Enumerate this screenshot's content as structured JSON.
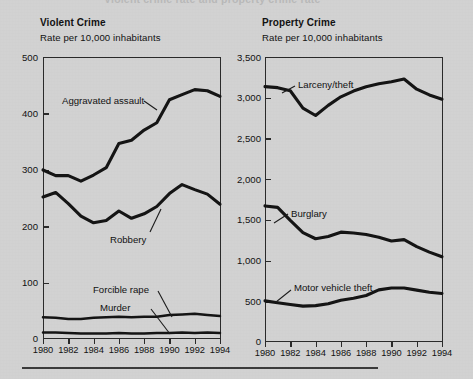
{
  "page": {
    "background_color": "#d2d2d2",
    "ink_color": "#141414",
    "cropped_top_title": "Violent crime rate and property crime rate"
  },
  "bottom_rule": "",
  "panels": [
    {
      "id": "violent-crime",
      "title": "Violent Crime",
      "subtitle": "Rate per 10,000 inhabitants"
    },
    {
      "id": "property-crime",
      "title": "Property Crime",
      "subtitle": "Rate per 10,000 inhabitants"
    }
  ],
  "chart_data": [
    {
      "type": "line",
      "title": "Violent Crime",
      "subtitle": "Rate per 10,000 inhabitants",
      "xlabel": "",
      "ylabel": "Rate per 10,000 inhabitants",
      "grid": false,
      "legend": "inline-annotations",
      "x": [
        1980,
        1981,
        1982,
        1983,
        1984,
        1985,
        1986,
        1987,
        1988,
        1989,
        1990,
        1991,
        1992,
        1993,
        1994
      ],
      "xticks": [
        "1980",
        "1982",
        "1984",
        "1986",
        "1988",
        "1990",
        "1992",
        "1994"
      ],
      "ylim": [
        0,
        500
      ],
      "yticks": [
        "0",
        "100",
        "200",
        "300",
        "400",
        "500"
      ],
      "series": [
        {
          "name": "Aggravated assault",
          "values": [
            299,
            289,
            289,
            279,
            290,
            303,
            346,
            352,
            370,
            383,
            424,
            433,
            442,
            440,
            430
          ]
        },
        {
          "name": "Robbery",
          "values": [
            251,
            259,
            239,
            217,
            205,
            209,
            226,
            213,
            221,
            234,
            257,
            273,
            264,
            256,
            238
          ]
        },
        {
          "name": "Forcible rape",
          "values": [
            37,
            36,
            34,
            34,
            36,
            37,
            38,
            37,
            38,
            38,
            41,
            42,
            43,
            41,
            39
          ]
        },
        {
          "name": "Murder",
          "values": [
            10,
            10,
            9,
            8,
            8,
            8,
            9,
            8,
            8,
            9,
            9,
            10,
            9,
            10,
            9
          ]
        }
      ]
    },
    {
      "type": "line",
      "title": "Property Crime",
      "subtitle": "Rate per 10,000 inhabitants",
      "xlabel": "",
      "ylabel": "Rate per 10,000 inhabitants",
      "grid": false,
      "legend": "inline-annotations",
      "x": [
        1980,
        1981,
        1982,
        1983,
        1984,
        1985,
        1986,
        1987,
        1988,
        1989,
        1990,
        1991,
        1992,
        1993,
        1994
      ],
      "xticks": [
        "1980",
        "1982",
        "1984",
        "1986",
        "1988",
        "1990",
        "1992",
        "1994"
      ],
      "ylim": [
        0,
        3500
      ],
      "yticks": [
        "0",
        "500",
        "1,000",
        "1,500",
        "2,000",
        "2,500",
        "3,000",
        "3,500"
      ],
      "series": [
        {
          "name": "Larceny/theft",
          "values": [
            3135,
            3123,
            3085,
            2870,
            2780,
            2905,
            3010,
            3081,
            3135,
            3171,
            3195,
            3229,
            3104,
            3033,
            2980
          ]
        },
        {
          "name": "Burglary",
          "values": [
            1668,
            1650,
            1490,
            1340,
            1264,
            1292,
            1345,
            1335,
            1316,
            1283,
            1236,
            1253,
            1168,
            1100,
            1042
          ]
        },
        {
          "name": "Motor vehicle theft",
          "values": [
            500,
            476,
            455,
            435,
            441,
            464,
            508,
            531,
            566,
            635,
            659,
            659,
            632,
            606,
            591
          ]
        }
      ]
    }
  ],
  "annotations": {
    "violent": [
      {
        "name": "aggravated-assault",
        "label": "Aggravated assault"
      },
      {
        "name": "robbery",
        "label": "Robbery"
      },
      {
        "name": "forcible-rape",
        "label": "Forcible rape"
      },
      {
        "name": "murder",
        "label": "Murder"
      }
    ],
    "property": [
      {
        "name": "larceny-theft",
        "label": "Larceny/theft"
      },
      {
        "name": "burglary",
        "label": "Burglary"
      },
      {
        "name": "motor-vehicle-theft",
        "label": "Motor vehicle theft"
      }
    ]
  }
}
